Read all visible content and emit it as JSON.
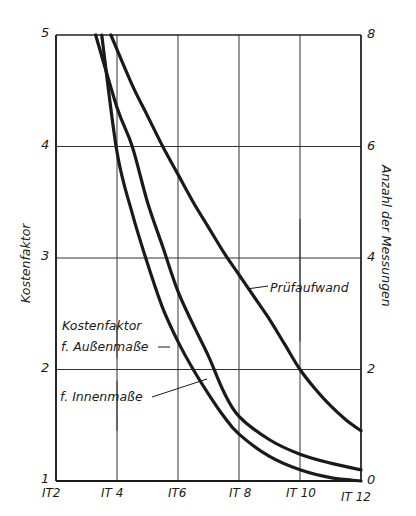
{
  "chart_data": {
    "type": "line",
    "title": "",
    "xlabel": "",
    "ylabel": "Kostenfaktor",
    "y2label": "Anzahl der Messungen",
    "x_tick_labels": [
      "IT2",
      "IT 4",
      "IT6",
      "IT 8",
      "IT 10",
      "IT 12"
    ],
    "x_ticks": [
      2,
      4,
      6,
      8,
      10,
      12
    ],
    "xlim": [
      2,
      12
    ],
    "y_tick_labels": [
      "1",
      "2",
      "3",
      "4",
      "5"
    ],
    "y_ticks": [
      1,
      2,
      3,
      4,
      5
    ],
    "ylim": [
      1,
      5
    ],
    "y2_tick_labels": [
      "0",
      "2",
      "4",
      "6",
      "8"
    ],
    "y2_ticks": [
      0,
      2,
      4,
      6,
      8
    ],
    "y2lim": [
      0,
      8
    ],
    "grid": true,
    "series": [
      {
        "name": "Kostenfaktor f. Außenmaße",
        "axis": "left",
        "x": [
          3.5,
          4,
          4.5,
          5,
          5.5,
          6,
          6.5,
          7,
          7.5,
          8,
          9,
          10,
          11,
          12
        ],
        "y": [
          5.0,
          3.95,
          3.4,
          2.95,
          2.55,
          2.25,
          2.0,
          1.78,
          1.58,
          1.42,
          1.22,
          1.1,
          1.03,
          1.0
        ]
      },
      {
        "name": "Kostenfaktor f. Innenmaße",
        "axis": "left",
        "x": [
          3.3,
          4,
          4.5,
          5,
          5.5,
          6,
          6.5,
          7,
          7.5,
          8,
          9,
          10,
          11,
          12
        ],
        "y": [
          5.0,
          4.35,
          4.0,
          3.5,
          3.1,
          2.7,
          2.4,
          2.12,
          1.8,
          1.58,
          1.37,
          1.24,
          1.16,
          1.1
        ]
      },
      {
        "name": "Prüfaufwand",
        "axis": "right",
        "x": [
          3.8,
          4.5,
          5,
          5.5,
          6,
          6.5,
          7,
          7.5,
          8,
          8.5,
          9,
          9.5,
          10,
          10.5,
          11,
          11.5,
          12
        ],
        "y": [
          8.0,
          7.1,
          6.55,
          6.0,
          5.5,
          5.0,
          4.55,
          4.1,
          3.7,
          3.3,
          2.9,
          2.45,
          2.0,
          1.65,
          1.35,
          1.1,
          0.9
        ]
      }
    ],
    "annotations": [
      {
        "text": "Kostenfaktor",
        "line": 1
      },
      {
        "text": "f. Außenmaße",
        "line": 2
      },
      {
        "text": "f. Innenmaße",
        "line": 1
      },
      {
        "text": "Prüfaufwand",
        "line": 1
      }
    ],
    "legend": "none (inline leader-line annotations)"
  },
  "labels": {
    "y_axis_left": "Kostenfaktor",
    "y_axis_right": "Anzahl der Messungen",
    "annot_aussen_1": "Kostenfaktor",
    "annot_aussen_2": "f. Außenmaße",
    "annot_innen": "f. Innenmaße",
    "annot_pruef": "Prüfaufwand"
  },
  "colors": {
    "line": "#1a1a1a",
    "grid": "#333333",
    "background": "#ffffff"
  }
}
